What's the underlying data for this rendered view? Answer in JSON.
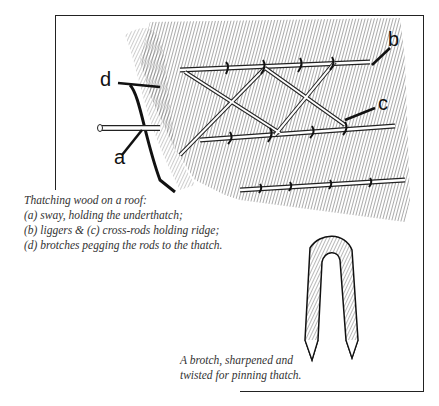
{
  "illustration": {
    "labels": {
      "a": "a",
      "b": "b",
      "c": "c",
      "d": "d"
    }
  },
  "caption_main": {
    "lines": [
      "Thatching wood on a roof:",
      "(a) sway, holding the underthatch;",
      "(b) liggers & (c) cross-rods holding ridge;",
      "(d) brotches pegging the rods to the thatch."
    ]
  },
  "caption_brotch": {
    "lines": [
      "A brotch, sharpened and",
      "twisted for pinning thatch."
    ]
  }
}
